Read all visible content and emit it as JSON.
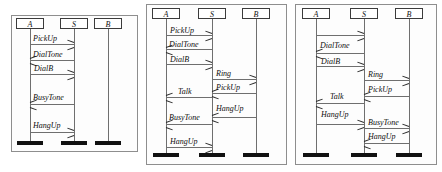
{
  "figure": {
    "type": "uml-sequence-diagram-set",
    "panel_count": 3
  },
  "participants": {
    "a": "A",
    "s": "S",
    "b": "B"
  },
  "panels": [
    {
      "id": "panel-1",
      "lifelines": [
        "A",
        "S",
        "B"
      ],
      "messages": [
        {
          "label": "PickUp",
          "from": "A",
          "to": "S",
          "dir": "right"
        },
        {
          "label": "DialTone",
          "from": "S",
          "to": "A",
          "dir": "left"
        },
        {
          "label": "DialB",
          "from": "A",
          "to": "S",
          "dir": "right"
        },
        {
          "label": "BusyTone",
          "from": "S",
          "to": "A",
          "dir": "left"
        },
        {
          "label": "HangUp",
          "from": "A",
          "to": "S",
          "dir": "right"
        }
      ]
    },
    {
      "id": "panel-2",
      "lifelines": [
        "A",
        "S",
        "B"
      ],
      "messages": [
        {
          "label": "PickUp",
          "from": "A",
          "to": "S",
          "dir": "right"
        },
        {
          "label": "DialTone",
          "from": "S",
          "to": "A",
          "dir": "left"
        },
        {
          "label": "DialB",
          "from": "A",
          "to": "S",
          "dir": "right"
        },
        {
          "label": "Ring",
          "from": "S",
          "to": "B",
          "dir": "right"
        },
        {
          "label": "PickUp",
          "from": "B",
          "to": "S",
          "dir": "left"
        },
        {
          "label": "Talk",
          "from": "S",
          "to": "A",
          "dir": "left"
        },
        {
          "label": "HangUp",
          "from": "B",
          "to": "S",
          "dir": "left"
        },
        {
          "label": "BusyTone",
          "from": "S",
          "to": "A",
          "dir": "left"
        },
        {
          "label": "HangUp",
          "from": "A",
          "to": "S",
          "dir": "right"
        }
      ]
    },
    {
      "id": "panel-3",
      "lifelines": [
        "A",
        "S",
        "B"
      ],
      "messages": [
        {
          "label": "",
          "from": "A",
          "to": "S",
          "dir": "right"
        },
        {
          "label": "DialTone",
          "from": "S",
          "to": "A",
          "dir": "left"
        },
        {
          "label": "DialB",
          "from": "A",
          "to": "S",
          "dir": "right"
        },
        {
          "label": "Ring",
          "from": "S",
          "to": "B",
          "dir": "right"
        },
        {
          "label": "PickUp",
          "from": "B",
          "to": "S",
          "dir": "left"
        },
        {
          "label": "Talk",
          "from": "S",
          "to": "A",
          "dir": "left"
        },
        {
          "label": "HangUp",
          "from": "A",
          "to": "S",
          "dir": "right"
        },
        {
          "label": "BusyTone",
          "from": "S",
          "to": "B",
          "dir": "right"
        },
        {
          "label": "HangUp",
          "from": "B",
          "to": "S",
          "dir": "left"
        }
      ]
    }
  ],
  "colors": {
    "panel_border": "#8e8e8e",
    "lifeline": "#6f6f6f",
    "foot": "#111111",
    "text": "#0d0d0d",
    "background": "#ffffff"
  }
}
